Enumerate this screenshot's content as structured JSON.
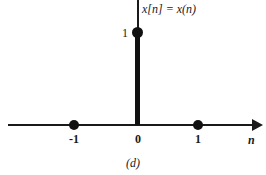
{
  "figure": {
    "caption": "(d)",
    "signal_label": "x[n] = x(n)",
    "amplitude_label": "1",
    "axis_variable": "n",
    "ink_color": "#1a1a1a",
    "background_color": "#ffffff"
  },
  "chart_data": {
    "type": "bar",
    "title": "x[n] = x(n)",
    "subtitle": "(d)",
    "xlabel": "n",
    "ylabel": "",
    "categories": [
      "-1",
      "0",
      "1"
    ],
    "x": [
      -1,
      0,
      1
    ],
    "values": [
      0,
      1,
      0
    ],
    "tick_labels": [
      "-1",
      "0",
      "1"
    ],
    "y_tick_labels": [
      "1"
    ],
    "y_ticks": [
      1
    ],
    "xlim": [
      -2,
      2
    ],
    "ylim": [
      0,
      1.35
    ],
    "grid": false,
    "legend": null,
    "annotations": [
      {
        "text": "x[n] = x(n)",
        "position": "top-right-of-y-axis"
      },
      {
        "text": "(d)",
        "position": "below-figure"
      }
    ],
    "markers": [
      {
        "x": -1,
        "y": 0,
        "shape": "filled-circle"
      },
      {
        "x": 0,
        "y": 1,
        "shape": "filled-circle"
      },
      {
        "x": 1,
        "y": 0,
        "shape": "filled-circle"
      }
    ]
  }
}
